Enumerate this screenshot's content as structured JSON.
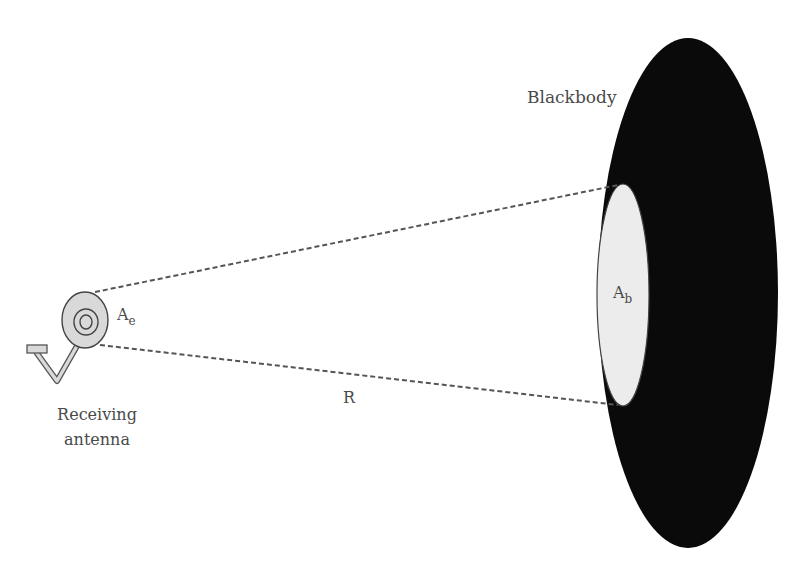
{
  "labels": {
    "blackbody": "Blackbody",
    "receiving_line1": "Receiving",
    "receiving_line2": "antenna",
    "distance": "R",
    "antenna_area_main": "A",
    "antenna_area_sub": "e",
    "blackbody_area_main": "A",
    "blackbody_area_sub": "b"
  },
  "colors": {
    "blackbody_fill": "#0a0a0a",
    "projected_area_fill": "#ececec",
    "antenna_fill": "#d9d9d9",
    "line_color": "#555555",
    "text_color": "#4a4a4a"
  }
}
